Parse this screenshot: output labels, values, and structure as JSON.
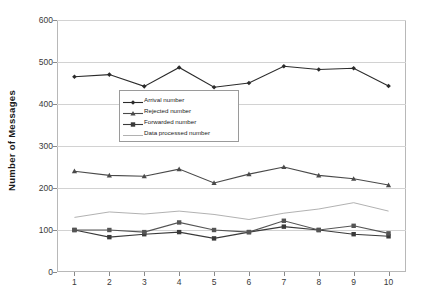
{
  "chart_data": {
    "type": "line",
    "title": "",
    "xlabel": "",
    "ylabel": "Number of Messages",
    "x": [
      1,
      2,
      3,
      4,
      5,
      6,
      7,
      8,
      9,
      10
    ],
    "xtick_labels": [
      "1",
      "2",
      "3",
      "4",
      "5",
      "6",
      "7",
      "8",
      "9",
      "10"
    ],
    "ytick_labels": [
      "0",
      "100",
      "200",
      "300",
      "400",
      "500",
      "600"
    ],
    "ylim": [
      0,
      600
    ],
    "ytick_step": 100,
    "grid": "horizontal",
    "legend_position": "center-left-inside",
    "series": [
      {
        "name": "Arrival number",
        "marker": "diamond",
        "color": "#2b2b2b",
        "values": [
          465,
          470,
          442,
          487,
          440,
          450,
          490,
          482,
          485,
          443
        ]
      },
      {
        "name": "Rejected number",
        "marker": "triangle",
        "color": "#4a4a4a",
        "values": [
          240,
          230,
          228,
          245,
          212,
          233,
          250,
          230,
          222,
          207
        ]
      },
      {
        "name": "Forwarded number",
        "marker": "square",
        "color": "#3a3a3a",
        "values": [
          100,
          83,
          90,
          95,
          80,
          95,
          108,
          100,
          90,
          85
        ]
      },
      {
        "name": "Data processed number",
        "marker": "none",
        "color": "#a8a8a8",
        "values": [
          130,
          143,
          138,
          145,
          137,
          125,
          140,
          150,
          165,
          145
        ]
      },
      {
        "name": "Series overlap lower",
        "marker": "square",
        "color": "#555555",
        "values": [
          100,
          100,
          95,
          118,
          100,
          95,
          122,
          100,
          110,
          92
        ]
      }
    ],
    "legend_entries": [
      "Arrival number",
      "Rejected number",
      "Forwarded number",
      "Data processed number"
    ]
  }
}
